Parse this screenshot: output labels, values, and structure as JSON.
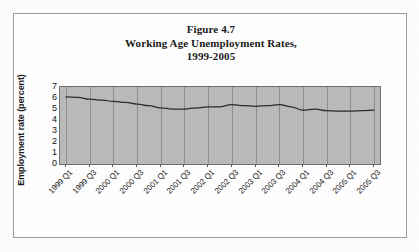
{
  "figure": {
    "title_lines": [
      "Figure 4.7",
      "Working Age Unemployment Rates,",
      "1999-2005"
    ],
    "title_line_1": "Figure 4.7",
    "title_line_2": "Working Age Unemployment Rates,",
    "title_line_3": "1999-2005"
  },
  "colors": {
    "plot_background": "#b9b9b9",
    "gridline": "#8d8d8d",
    "series_line": "#2b2b2b",
    "axis": "#6f6f6f",
    "frame": "#9a9a9a",
    "page_background": "#fdfdfd",
    "text": "#1b1b1b"
  },
  "chart_data": {
    "type": "line",
    "title": "Figure 4.7 Working Age Unemployment Rates, 1999-2005",
    "xlabel": "",
    "ylabel": "Employment rate (percent)",
    "ylim": [
      0,
      7
    ],
    "yticks": [
      0,
      1,
      2,
      3,
      4,
      5,
      6,
      7
    ],
    "ytick_labels": [
      "0",
      "1",
      "2",
      "3",
      "4",
      "5",
      "6",
      "7"
    ],
    "grid": "vertical",
    "legend": "none",
    "categories": [
      "1999 Q1",
      "1999 Q2",
      "1999 Q3",
      "1999 Q4",
      "2000 Q1",
      "2000 Q2",
      "2000 Q3",
      "2000 Q4",
      "2001 Q1",
      "2001 Q2",
      "2001 Q3",
      "2001 Q4",
      "2002 Q1",
      "2002 Q2",
      "2002 Q3",
      "2002 Q4",
      "2003 Q1",
      "2003 Q2",
      "2003 Q3",
      "2003 Q4",
      "2004 Q1",
      "2004 Q2",
      "2004 Q3",
      "2004 Q4",
      "2005 Q1",
      "2005 Q2",
      "2005 Q3"
    ],
    "tick_labels_shown": [
      "1999 Q1",
      "1999 Q3",
      "2000 Q1",
      "2000 Q3",
      "2001 Q1",
      "2001 Q3",
      "2002 Q1",
      "2002 Q3",
      "2003 Q1",
      "2003 Q3",
      "2004 Q1",
      "2004 Q3",
      "2005 Q1",
      "2005 Q3"
    ],
    "values": [
      6.1,
      6.05,
      5.9,
      5.8,
      5.7,
      5.6,
      5.45,
      5.3,
      5.1,
      5.0,
      5.0,
      5.1,
      5.2,
      5.2,
      5.4,
      5.3,
      5.25,
      5.3,
      5.4,
      5.2,
      4.9,
      5.0,
      4.85,
      4.8,
      4.8,
      4.85,
      4.9
    ],
    "series": [
      {
        "name": "Working age unemployment rate",
        "values": [
          6.1,
          6.05,
          5.9,
          5.8,
          5.7,
          5.6,
          5.45,
          5.3,
          5.1,
          5.0,
          5.0,
          5.1,
          5.2,
          5.2,
          5.4,
          5.3,
          5.25,
          5.3,
          5.4,
          5.2,
          4.9,
          5.0,
          4.85,
          4.8,
          4.8,
          4.85,
          4.9
        ]
      }
    ]
  }
}
